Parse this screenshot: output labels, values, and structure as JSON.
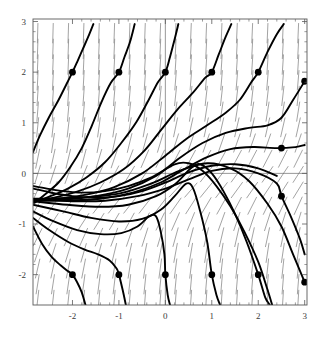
{
  "figure": {
    "type": "slope-field-plot",
    "title": "",
    "background_color": "#ffffff",
    "frame_color": "#5a5a5a",
    "axis_color": "#6a6a6a",
    "curve_color": "#000000",
    "field_color": "#8c8c8c",
    "point_color": "#000000"
  },
  "chart_data": {
    "type": "line",
    "title": "",
    "xlabel": "",
    "ylabel": "",
    "xlim": [
      -2.85,
      3.05
    ],
    "ylim": [
      -2.6,
      3.05
    ],
    "grid": false,
    "legend": "none",
    "axes": {
      "x_ticks": [
        -2,
        -1,
        0,
        1,
        2,
        3
      ],
      "x_tick_labels": [
        "-2",
        "-1",
        "0",
        "1",
        "2",
        "3"
      ],
      "y_ticks": [
        -2,
        -1,
        0,
        1,
        2,
        3
      ],
      "y_tick_labels": [
        "-2",
        "-1",
        "0",
        "1",
        "2",
        "3"
      ],
      "x_axis_line_at_y": 0,
      "y_axis_line_at_x": 0,
      "minor_tick_count_per_interval": 4
    },
    "slope_field": {
      "description": "dashed direction-field segments tilted up-to-the-right, steeper near edges",
      "x_start": -2.75,
      "x_end": 3.0,
      "x_step": 0.33,
      "y_start": -2.5,
      "y_end": 2.95,
      "y_step": 0.31,
      "segment_length": 0.2,
      "color": "#8c8c8c"
    },
    "marked_points": [
      {
        "x": -2.0,
        "y": 2.0
      },
      {
        "x": -1.0,
        "y": 2.0
      },
      {
        "x": 0.0,
        "y": 2.0
      },
      {
        "x": 1.0,
        "y": 2.0
      },
      {
        "x": 2.0,
        "y": 2.0
      },
      {
        "x": 3.0,
        "y": 1.82
      },
      {
        "x": 2.5,
        "y": 0.5
      },
      {
        "x": 2.5,
        "y": -0.45
      },
      {
        "x": -2.0,
        "y": -2.0
      },
      {
        "x": -1.0,
        "y": -2.0
      },
      {
        "x": 0.0,
        "y": -2.0
      },
      {
        "x": 1.0,
        "y": -2.0
      },
      {
        "x": 2.0,
        "y": -2.0
      },
      {
        "x": 3.0,
        "y": -2.15
      }
    ],
    "series": [
      {
        "name": "solution-through(-2,2)",
        "points": [
          [
            -2.85,
            0.42
          ],
          [
            -2.7,
            0.75
          ],
          [
            -2.5,
            1.12
          ],
          [
            -2.3,
            1.45
          ],
          [
            -2.12,
            1.78
          ],
          [
            -2.0,
            2.0
          ],
          [
            -1.9,
            2.2
          ],
          [
            -1.78,
            2.45
          ],
          [
            -1.66,
            2.7
          ],
          [
            -1.55,
            2.95
          ]
        ]
      },
      {
        "name": "solution-through(-1,2)",
        "points": [
          [
            -2.85,
            -0.6
          ],
          [
            -2.6,
            -0.42
          ],
          [
            -2.3,
            -0.18
          ],
          [
            -2.05,
            0.12
          ],
          [
            -1.8,
            0.5
          ],
          [
            -1.58,
            0.95
          ],
          [
            -1.38,
            1.4
          ],
          [
            -1.18,
            1.78
          ],
          [
            -1.0,
            2.0
          ],
          [
            -0.88,
            2.3
          ],
          [
            -0.76,
            2.6
          ],
          [
            -0.66,
            2.95
          ]
        ]
      },
      {
        "name": "solution-through(0,2)",
        "points": [
          [
            -2.85,
            -0.58
          ],
          [
            -2.5,
            -0.46
          ],
          [
            -2.1,
            -0.3
          ],
          [
            -1.7,
            -0.08
          ],
          [
            -1.3,
            0.22
          ],
          [
            -0.95,
            0.6
          ],
          [
            -0.62,
            1.02
          ],
          [
            -0.36,
            1.45
          ],
          [
            -0.16,
            1.8
          ],
          [
            0.0,
            2.0
          ],
          [
            0.1,
            2.3
          ],
          [
            0.2,
            2.65
          ],
          [
            0.28,
            2.95
          ]
        ]
      },
      {
        "name": "solution-through(1,2)",
        "points": [
          [
            -2.85,
            -0.56
          ],
          [
            -2.4,
            -0.48
          ],
          [
            -1.9,
            -0.36
          ],
          [
            -1.4,
            -0.18
          ],
          [
            -0.9,
            0.08
          ],
          [
            -0.45,
            0.45
          ],
          [
            -0.1,
            0.85
          ],
          [
            0.25,
            1.25
          ],
          [
            0.6,
            1.6
          ],
          [
            0.85,
            1.88
          ],
          [
            1.0,
            2.0
          ],
          [
            1.15,
            2.35
          ],
          [
            1.3,
            2.7
          ],
          [
            1.42,
            2.95
          ]
        ]
      },
      {
        "name": "solution-through(2,2)",
        "points": [
          [
            -2.85,
            -0.55
          ],
          [
            -2.3,
            -0.5
          ],
          [
            -1.7,
            -0.42
          ],
          [
            -1.1,
            -0.27
          ],
          [
            -0.5,
            0.0
          ],
          [
            0.0,
            0.35
          ],
          [
            0.45,
            0.68
          ],
          [
            0.9,
            0.95
          ],
          [
            1.3,
            1.2
          ],
          [
            1.6,
            1.45
          ],
          [
            1.85,
            1.8
          ],
          [
            2.0,
            2.0
          ],
          [
            2.2,
            2.4
          ],
          [
            2.4,
            2.75
          ],
          [
            2.55,
            2.95
          ]
        ]
      },
      {
        "name": "solution-through(3,1.82)",
        "points": [
          [
            -2.85,
            -0.54
          ],
          [
            -2.2,
            -0.52
          ],
          [
            -1.5,
            -0.45
          ],
          [
            -0.8,
            -0.3
          ],
          [
            -0.2,
            -0.05
          ],
          [
            0.3,
            0.3
          ],
          [
            0.8,
            0.6
          ],
          [
            1.3,
            0.8
          ],
          [
            1.8,
            0.9
          ],
          [
            2.2,
            0.95
          ],
          [
            2.5,
            1.1
          ],
          [
            2.75,
            1.45
          ],
          [
            3.0,
            1.82
          ]
        ]
      },
      {
        "name": "solution-through(2.5,0.5)",
        "points": [
          [
            -2.85,
            -0.53
          ],
          [
            -2.1,
            -0.53
          ],
          [
            -1.4,
            -0.5
          ],
          [
            -0.7,
            -0.38
          ],
          [
            -0.1,
            -0.18
          ],
          [
            0.4,
            0.08
          ],
          [
            0.9,
            0.32
          ],
          [
            1.4,
            0.48
          ],
          [
            1.9,
            0.52
          ],
          [
            2.4,
            0.5
          ],
          [
            2.8,
            0.52
          ],
          [
            3.0,
            0.56
          ]
        ]
      },
      {
        "name": "solution-separatrix-upper",
        "points": [
          [
            -2.85,
            -0.52
          ],
          [
            -2.0,
            -0.55
          ],
          [
            -1.3,
            -0.54
          ],
          [
            -0.6,
            -0.45
          ],
          [
            0.0,
            -0.3
          ],
          [
            0.5,
            -0.12
          ],
          [
            1.0,
            0.05
          ],
          [
            1.5,
            0.1
          ],
          [
            2.0,
            0.0
          ],
          [
            2.4,
            -0.2
          ],
          [
            2.5,
            -0.45
          ],
          [
            2.7,
            -0.85
          ],
          [
            2.9,
            -1.3
          ],
          [
            3.0,
            -1.6
          ]
        ]
      },
      {
        "name": "solution-through(2,-2)",
        "points": [
          [
            -2.85,
            -0.55
          ],
          [
            -2.1,
            -0.62
          ],
          [
            -1.4,
            -0.66
          ],
          [
            -0.8,
            -0.62
          ],
          [
            -0.2,
            -0.45
          ],
          [
            0.2,
            -0.22
          ],
          [
            0.55,
            0.1
          ],
          [
            0.75,
            0.18
          ],
          [
            1.0,
            0.0
          ],
          [
            1.25,
            -0.35
          ],
          [
            1.5,
            -0.8
          ],
          [
            1.75,
            -1.35
          ],
          [
            2.0,
            -2.0
          ],
          [
            2.15,
            -2.45
          ],
          [
            2.25,
            -2.6
          ]
        ]
      },
      {
        "name": "solution-through(1,-2)",
        "points": [
          [
            -2.85,
            -0.62
          ],
          [
            -2.2,
            -0.75
          ],
          [
            -1.6,
            -0.88
          ],
          [
            -1.0,
            -0.95
          ],
          [
            -0.5,
            -0.9
          ],
          [
            -0.1,
            -0.72
          ],
          [
            0.2,
            -0.45
          ],
          [
            0.45,
            -0.2
          ],
          [
            0.6,
            -0.3
          ],
          [
            0.75,
            -0.75
          ],
          [
            0.9,
            -1.35
          ],
          [
            1.0,
            -2.0
          ],
          [
            1.1,
            -2.4
          ],
          [
            1.18,
            -2.6
          ]
        ]
      },
      {
        "name": "solution-through(0,-2)",
        "points": [
          [
            -2.85,
            -0.75
          ],
          [
            -2.4,
            -0.95
          ],
          [
            -1.9,
            -1.12
          ],
          [
            -1.4,
            -1.2
          ],
          [
            -0.95,
            -1.18
          ],
          [
            -0.6,
            -1.05
          ],
          [
            -0.35,
            -0.85
          ],
          [
            -0.2,
            -0.85
          ],
          [
            -0.1,
            -1.15
          ],
          [
            -0.02,
            -1.6
          ],
          [
            0.0,
            -2.0
          ],
          [
            0.05,
            -2.4
          ],
          [
            0.1,
            -2.6
          ]
        ]
      },
      {
        "name": "solution-through(-1,-2)",
        "points": [
          [
            -2.85,
            -0.88
          ],
          [
            -2.5,
            -1.12
          ],
          [
            -2.1,
            -1.35
          ],
          [
            -1.75,
            -1.5
          ],
          [
            -1.45,
            -1.6
          ],
          [
            -1.2,
            -1.72
          ],
          [
            -1.05,
            -1.88
          ],
          [
            -1.0,
            -2.0
          ],
          [
            -0.92,
            -2.3
          ],
          [
            -0.85,
            -2.6
          ]
        ]
      },
      {
        "name": "solution-through(-2,-2)",
        "points": [
          [
            -2.85,
            -1.05
          ],
          [
            -2.65,
            -1.4
          ],
          [
            -2.45,
            -1.65
          ],
          [
            -2.25,
            -1.82
          ],
          [
            -2.1,
            -1.93
          ],
          [
            -2.0,
            -2.0
          ],
          [
            -1.9,
            -2.15
          ],
          [
            -1.8,
            -2.35
          ],
          [
            -1.72,
            -2.6
          ]
        ]
      },
      {
        "name": "solution-through(3,-2.15)",
        "points": [
          [
            -2.85,
            -0.5
          ],
          [
            -1.9,
            -0.48
          ],
          [
            -1.0,
            -0.4
          ],
          [
            -0.3,
            -0.2
          ],
          [
            0.3,
            0.05
          ],
          [
            0.9,
            0.2
          ],
          [
            1.4,
            0.1
          ],
          [
            1.8,
            -0.15
          ],
          [
            2.2,
            -0.6
          ],
          [
            2.5,
            -1.05
          ],
          [
            2.75,
            -1.6
          ],
          [
            3.0,
            -2.15
          ]
        ]
      },
      {
        "name": "solution-lower-left-fan",
        "points": [
          [
            -2.85,
            -0.3
          ],
          [
            -2.6,
            -0.35
          ],
          [
            -2.35,
            -0.4
          ],
          [
            -2.0,
            -0.45
          ],
          [
            -1.5,
            -0.48
          ],
          [
            -1.0,
            -0.45
          ],
          [
            -0.5,
            -0.35
          ],
          [
            0.0,
            -0.18
          ],
          [
            0.5,
            0.02
          ],
          [
            1.0,
            0.15
          ],
          [
            1.5,
            0.18
          ],
          [
            2.0,
            0.1
          ],
          [
            2.4,
            -0.05
          ]
        ]
      },
      {
        "name": "solution-left-fan-upper",
        "points": [
          [
            -2.85,
            -0.25
          ],
          [
            -2.55,
            -0.3
          ],
          [
            -2.2,
            -0.35
          ],
          [
            -1.8,
            -0.38
          ],
          [
            -1.3,
            -0.35
          ],
          [
            -0.8,
            -0.25
          ],
          [
            -0.3,
            -0.08
          ],
          [
            0.2,
            0.18
          ],
          [
            0.5,
            0.2
          ],
          [
            0.8,
            0.05
          ],
          [
            1.1,
            -0.25
          ],
          [
            1.4,
            -0.65
          ],
          [
            1.7,
            -1.15
          ],
          [
            2.0,
            -1.75
          ],
          [
            2.2,
            -2.3
          ],
          [
            2.3,
            -2.6
          ]
        ]
      }
    ]
  }
}
